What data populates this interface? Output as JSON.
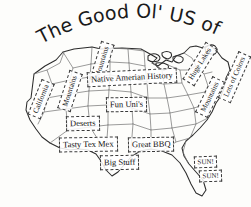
{
  "page": {
    "kind": "hand-drawn-map",
    "background_color": "#fdfdfb",
    "ink_color": "#2b2b2b"
  },
  "title": {
    "text": "The Good Ol' US of A",
    "style": "arched-handwritten",
    "color": "#1a1a1a"
  },
  "map": {
    "subject": "United States of America",
    "outline_color": "#2b2b2b",
    "state_border_color": "#6b6b6b"
  },
  "labels": [
    {
      "id": "california",
      "text": "California",
      "rotation": -68,
      "x": 22,
      "y": 92,
      "size": "sm"
    },
    {
      "id": "mountains-west",
      "text": "Mountains",
      "rotation": -72,
      "x": 50,
      "y": 84,
      "size": "sm"
    },
    {
      "id": "mountains-nw",
      "text": "Mountains",
      "rotation": -73,
      "x": 82,
      "y": 55,
      "size": "sm"
    },
    {
      "id": "native-history",
      "text": "Native Amerian History",
      "rotation": -3,
      "x": 87,
      "y": 70,
      "size": ""
    },
    {
      "id": "huge-lakes",
      "text": "Huge Lakes",
      "rotation": -58,
      "x": 178,
      "y": 57,
      "size": "sm"
    },
    {
      "id": "mountains-east",
      "text": "Mountains",
      "rotation": -64,
      "x": 190,
      "y": 90,
      "size": "sm"
    },
    {
      "id": "lots-of-colors",
      "text": "Lots of Colors",
      "rotation": -66,
      "x": 209,
      "y": 70,
      "size": "sm"
    },
    {
      "id": "fun-unis",
      "text": "Fun Uni's",
      "rotation": -1,
      "x": 106,
      "y": 97,
      "size": ""
    },
    {
      "id": "deserts",
      "text": "Deserts",
      "rotation": -1,
      "x": 66,
      "y": 116,
      "size": ""
    },
    {
      "id": "tasty-tex-mex",
      "text": "Tasty Tex Mex",
      "rotation": -1,
      "x": 59,
      "y": 137,
      "size": ""
    },
    {
      "id": "great-bbq",
      "text": "Great BBQ",
      "rotation": -1,
      "x": 128,
      "y": 137,
      "size": ""
    },
    {
      "id": "big-stuff",
      "text": "Big Stuff",
      "rotation": -1,
      "x": 100,
      "y": 155,
      "size": ""
    },
    {
      "id": "sun-1",
      "text": "SUN!",
      "rotation": -2,
      "x": 194,
      "y": 156,
      "size": "xs"
    },
    {
      "id": "sun-2",
      "text": "SUN!",
      "rotation": -2,
      "x": 199,
      "y": 170,
      "size": "xs"
    }
  ]
}
